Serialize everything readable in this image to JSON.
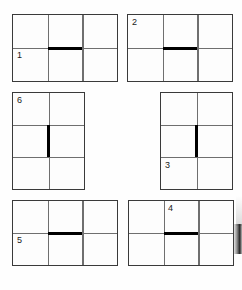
{
  "diagram": {
    "background_color": "#ffffff",
    "panel_border_color": "#3a3a3a",
    "grid_line_color": "#6f6f6f",
    "emphasis_color": "#000000",
    "panel_count": 6,
    "panels": [
      {
        "id": "panel-1",
        "label": "1",
        "columns": 3,
        "rows": 2,
        "label_cell": "bottom-left",
        "emphasis": {
          "orientation": "horizontal",
          "segment": "middle-column",
          "row_boundary": 1
        }
      },
      {
        "id": "panel-2",
        "label": "2",
        "columns": 3,
        "rows": 2,
        "label_cell": "top-left",
        "emphasis": {
          "orientation": "horizontal",
          "segment": "middle-column",
          "row_boundary": 1
        }
      },
      {
        "id": "panel-6",
        "label": "6",
        "columns": 2,
        "rows": 3,
        "label_cell": "top-left",
        "emphasis": {
          "orientation": "vertical",
          "segment": "middle-row",
          "column_boundary": 1
        }
      },
      {
        "id": "panel-3",
        "label": "3",
        "columns": 2,
        "rows": 3,
        "label_cell": "bottom-left",
        "emphasis": {
          "orientation": "vertical",
          "segment": "middle-row",
          "column_boundary": 1
        }
      },
      {
        "id": "panel-5",
        "label": "5",
        "columns": 3,
        "rows": 2,
        "label_cell": "bottom-left",
        "emphasis": {
          "orientation": "horizontal",
          "segment": "middle-column",
          "row_boundary": 1
        }
      },
      {
        "id": "panel-4",
        "label": "4",
        "columns": 3,
        "rows": 2,
        "label_cell": "top-middle",
        "emphasis": {
          "orientation": "horizontal",
          "segment": "middle-column",
          "row_boundary": 1
        }
      }
    ]
  }
}
